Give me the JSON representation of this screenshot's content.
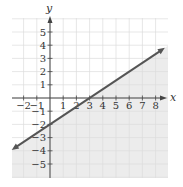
{
  "chart_data": {
    "type": "line",
    "title": "",
    "xlabel": "x",
    "ylabel": "y",
    "xlim": [
      -2.9,
      8.9
    ],
    "ylim": [
      -6,
      6
    ],
    "grid": true,
    "x_ticks": [
      -2,
      -1,
      1,
      2,
      3,
      4,
      5,
      6,
      7,
      8
    ],
    "y_ticks": [
      5,
      4,
      3,
      2,
      1,
      -1,
      -2,
      -3,
      -4,
      -5
    ],
    "series": [
      {
        "name": "y = (2/3)x - 2",
        "slope": 0.6667,
        "intercept": -2,
        "points": [
          [
            -2.9,
            -3.93
          ],
          [
            0,
            -2
          ],
          [
            3,
            0
          ],
          [
            8.7,
            3.8
          ]
        ],
        "arrows": "both",
        "color": "#555555"
      }
    ],
    "shaded_region": "below line",
    "shade_color": "#ececec"
  },
  "colors": {
    "grid": "#dcdcdc",
    "axis": "#444444",
    "line": "#555555",
    "shade": "#ececec"
  }
}
